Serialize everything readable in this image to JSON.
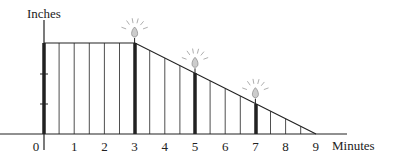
{
  "ylabel": "Inches",
  "xlabel": "Minutes",
  "x_ticks": [
    "0",
    "1",
    "2",
    "3",
    "4",
    "5",
    "6",
    "7",
    "8",
    "9"
  ],
  "chart_data": {
    "type": "line",
    "title": "",
    "xlabel": "Minutes",
    "ylabel": "Inches",
    "x": [
      0,
      3,
      9
    ],
    "values": [
      3,
      3,
      0
    ],
    "xlim": [
      0,
      9
    ],
    "ylim": [
      0,
      3
    ],
    "x_tick_labels": [
      "0",
      "1",
      "2",
      "3",
      "4",
      "5",
      "6",
      "7",
      "8",
      "9"
    ],
    "y_tick_labels": [],
    "grid": false,
    "annotations": [
      {
        "x": 0,
        "label": "candle (thick bar)",
        "height": 3
      },
      {
        "x": 3,
        "label": "lit candle",
        "height": 3
      },
      {
        "x": 5,
        "label": "lit candle",
        "height": 2
      },
      {
        "x": 7,
        "label": "lit candle",
        "height": 1
      }
    ],
    "vertical_lines_every": 0.5
  }
}
